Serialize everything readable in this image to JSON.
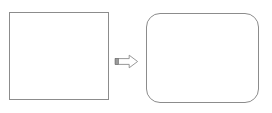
{
  "diagram": {
    "background_color": "#ffffff",
    "stroke_color": "#8c8c8c",
    "fill_color": "#ffffff",
    "nodes": [
      {
        "id": "source-square",
        "shape": "rectangle",
        "label": "",
        "x": 9,
        "y": 12,
        "width": 100,
        "height": 88,
        "corner_radius": 0,
        "stroke": "#8c8c8c",
        "fill": "#ffffff"
      },
      {
        "id": "target-rounded-rectangle",
        "shape": "rounded-rectangle",
        "label": "",
        "x": 146,
        "y": 13,
        "width": 113,
        "height": 90,
        "corner_radius": 14,
        "stroke": "#8c8c8c",
        "fill": "#ffffff"
      }
    ],
    "connectors": [
      {
        "id": "transform-arrow",
        "shape": "block-arrow",
        "direction": "right",
        "label": "",
        "from": "source-square",
        "to": "target-rounded-rectangle",
        "x": 114,
        "y": 54,
        "width": 25,
        "height": 15,
        "stroke": "#8c8c8c",
        "fill": "#ffffff",
        "tail_marker_color": "#9a9a9a"
      }
    ]
  }
}
